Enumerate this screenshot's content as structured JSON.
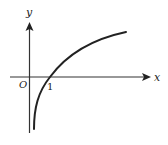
{
  "diagram": {
    "type": "function-graph",
    "labels": {
      "x_axis": "x",
      "y_axis": "y",
      "origin": "O",
      "x_intercept": "1"
    },
    "curve": {
      "shape": "increasing concave, vertical asymptote near y-axis",
      "x_intercept": 1
    },
    "colors": {
      "stroke": "#222222",
      "background": "#ffffff"
    }
  }
}
